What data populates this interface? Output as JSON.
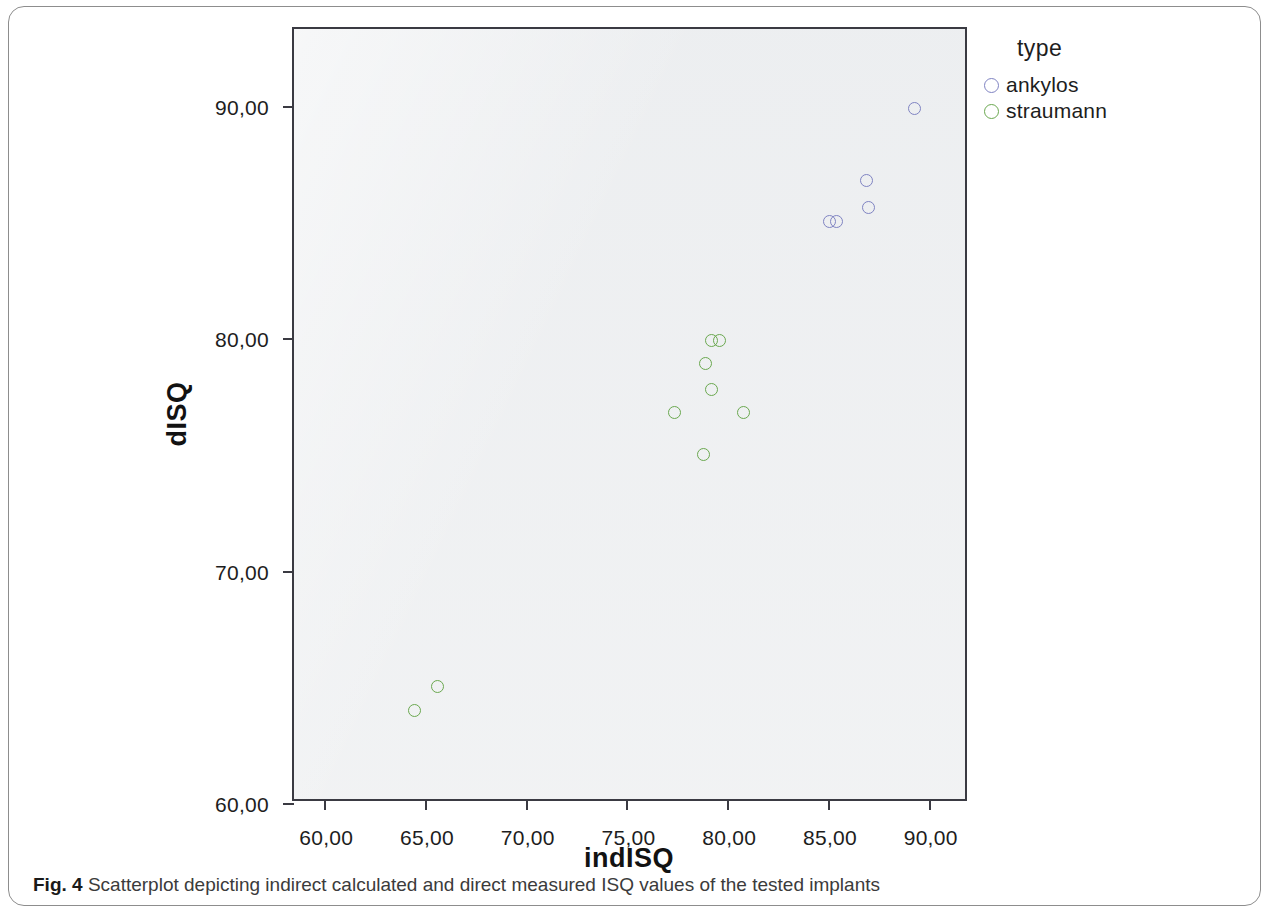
{
  "caption": {
    "figure_label": "Fig. 4",
    "text": "Scatterplot depicting indirect calculated and direct measured ISQ values of the tested implants"
  },
  "legend": {
    "title": "type",
    "entries": [
      {
        "label": "ankylos",
        "color": "#7f83c2"
      },
      {
        "label": "straumann",
        "color": "#6aa84f"
      }
    ]
  },
  "axes": {
    "x_title": "indISQ",
    "y_title": "dISQ",
    "x_ticks": [
      "60,00",
      "65,00",
      "70,00",
      "75,00",
      "80,00",
      "85,00",
      "90,00"
    ],
    "y_ticks": [
      "60,00",
      "70,00",
      "80,00",
      "90,00"
    ]
  },
  "chart_data": {
    "type": "scatter",
    "title": "",
    "xlabel": "indISQ",
    "ylabel": "dISQ",
    "xlim": [
      58.5,
      92.0
    ],
    "ylim": [
      60.0,
      93.3
    ],
    "x_tick_values": [
      60,
      65,
      70,
      75,
      80,
      85,
      90
    ],
    "y_tick_values": [
      60,
      70,
      80,
      90
    ],
    "grid": false,
    "legend_position": "right",
    "legend_title": "type",
    "decimal_separator": ",",
    "series": [
      {
        "name": "ankylos",
        "color": "#7f83c2",
        "points": [
          {
            "x": 89.3,
            "y": 89.9
          },
          {
            "x": 86.9,
            "y": 86.8
          },
          {
            "x": 87.0,
            "y": 85.6
          },
          {
            "x": 85.1,
            "y": 85.0
          },
          {
            "x": 85.4,
            "y": 85.0
          }
        ]
      },
      {
        "name": "straumann",
        "color": "#6aa84f",
        "points": [
          {
            "x": 79.2,
            "y": 79.9
          },
          {
            "x": 79.6,
            "y": 79.9
          },
          {
            "x": 78.9,
            "y": 78.9
          },
          {
            "x": 79.2,
            "y": 77.8
          },
          {
            "x": 77.4,
            "y": 76.8
          },
          {
            "x": 80.8,
            "y": 76.8
          },
          {
            "x": 78.8,
            "y": 75.0
          },
          {
            "x": 65.6,
            "y": 65.0
          },
          {
            "x": 64.5,
            "y": 64.0
          }
        ]
      }
    ]
  }
}
